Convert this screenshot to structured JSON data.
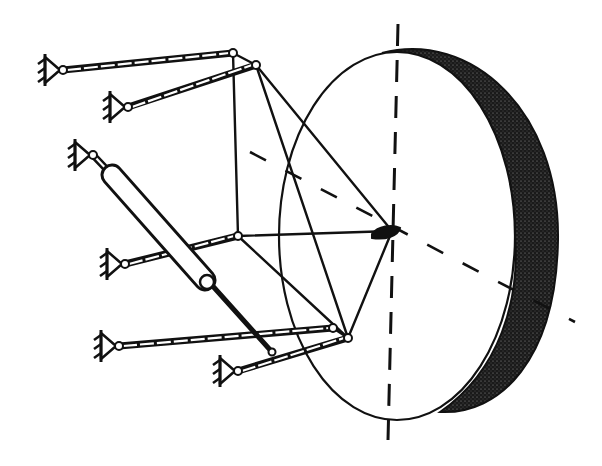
{
  "diagram": {
    "title": "",
    "colors": {
      "ink": "#111111",
      "background": "#ffffff",
      "rim_shade": "#1a1a1a"
    },
    "disc": {
      "front_face": {
        "cx": 397,
        "cy": 236,
        "rx": 118,
        "ry": 184
      },
      "rim_outer": {
        "cx": 438,
        "cy": 228,
        "rx": 120,
        "ry": 187
      }
    },
    "hub": {
      "x": 392,
      "y": 231
    },
    "axes": {
      "vertical": {
        "x1": 398,
        "y1": 24,
        "x2": 388,
        "y2": 438,
        "style": "dashed"
      },
      "horizontal": {
        "x1": 250,
        "y1": 152,
        "x2": 575,
        "y2": 322,
        "style": "dashed"
      }
    },
    "nodes": [
      {
        "id": "A",
        "x": 233,
        "y": 53
      },
      {
        "id": "B",
        "x": 256,
        "y": 65
      },
      {
        "id": "C",
        "x": 238,
        "y": 236
      },
      {
        "id": "D",
        "x": 333,
        "y": 328
      },
      {
        "id": "E",
        "x": 348,
        "y": 338
      },
      {
        "id": "H",
        "x": 392,
        "y": 231
      }
    ],
    "ground_anchors": [
      {
        "id": "G1",
        "x": 63,
        "y": 70
      },
      {
        "id": "G2",
        "x": 128,
        "y": 107
      },
      {
        "id": "G3",
        "x": 93,
        "y": 155
      },
      {
        "id": "G4",
        "x": 125,
        "y": 264
      },
      {
        "id": "G5",
        "x": 119,
        "y": 346
      },
      {
        "id": "G6",
        "x": 238,
        "y": 371
      }
    ],
    "struts": [
      {
        "from": "G1",
        "to": "A",
        "type": "double"
      },
      {
        "from": "G2",
        "to": "B",
        "type": "double"
      },
      {
        "from": "G4",
        "to": "C",
        "type": "double"
      },
      {
        "from": "G5",
        "to": "D",
        "type": "double"
      },
      {
        "from": "G6",
        "to": "E",
        "type": "double"
      }
    ],
    "frame_links": [
      {
        "from": "A",
        "to": "B"
      },
      {
        "from": "A",
        "to": "C"
      },
      {
        "from": "B",
        "to": "H"
      },
      {
        "from": "B",
        "to": "E"
      },
      {
        "from": "C",
        "to": "H"
      },
      {
        "from": "C",
        "to": "E"
      },
      {
        "from": "D",
        "to": "E"
      },
      {
        "from": "H",
        "to": "E"
      }
    ],
    "actuator": {
      "anchor": "G3",
      "cylinder": {
        "x1": 112,
        "y1": 175,
        "x2": 205,
        "y2": 280,
        "width": 18
      },
      "rod": {
        "x1": 210,
        "y1": 283,
        "x2": 272,
        "y2": 352
      }
    }
  }
}
